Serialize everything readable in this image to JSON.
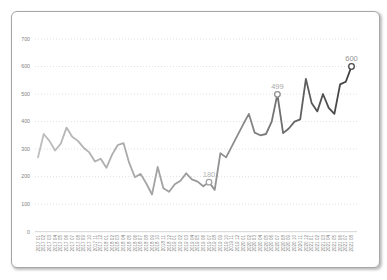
{
  "chart_data": {
    "type": "line",
    "title": "",
    "xlabel": "",
    "ylabel": "",
    "ylim": [
      0,
      700
    ],
    "y_ticks": [
      0,
      100,
      200,
      300,
      400,
      500,
      600,
      700
    ],
    "grid": "horizontal-dotted",
    "legend": "none",
    "marker_style": "open-circle",
    "categories": [
      "2017 01",
      "2017 02",
      "2017 03",
      "2017 04",
      "2017 05",
      "2017 06",
      "2017 07",
      "2017 08",
      "2017 09",
      "2017 10",
      "2017 11",
      "2017 12",
      "2018 01",
      "2018 02",
      "2018 03",
      "2018 04",
      "2018 05",
      "2018 06",
      "2018 07",
      "2018 08",
      "2018 09",
      "2018 10",
      "2018 11",
      "2018 12",
      "2019 01",
      "2019 02",
      "2019 03",
      "2019 04",
      "2019 05",
      "2019 06",
      "2019 07",
      "2019 08",
      "2019 09",
      "2019 10",
      "2019 11",
      "2019 12",
      "2020 01",
      "2020 02",
      "2020 03",
      "2020 04",
      "2020 05",
      "2020 06",
      "2020 07",
      "2020 08",
      "2020 09",
      "2020 10",
      "2020 11",
      "2020 12",
      "2021 01",
      "2021 02",
      "2021 03",
      "2021 04",
      "2021 05",
      "2021 06",
      "2021 07",
      "2021 08"
    ],
    "values": [
      270,
      355,
      330,
      295,
      320,
      378,
      345,
      330,
      305,
      288,
      255,
      265,
      232,
      280,
      315,
      322,
      250,
      198,
      210,
      175,
      135,
      235,
      158,
      145,
      172,
      185,
      212,
      190,
      182,
      165,
      180,
      152,
      285,
      270,
      310,
      350,
      390,
      428,
      360,
      350,
      355,
      400,
      499,
      358,
      375,
      400,
      408,
      555,
      468,
      437,
      500,
      450,
      428,
      535,
      545,
      600
    ],
    "annotations": [
      {
        "category": "2019 07",
        "value": 180,
        "label": "180",
        "marker_color": "#a3a3a3",
        "label_color": "#b2b2b2"
      },
      {
        "category": "2020 07",
        "value": 499,
        "label": "499",
        "marker_color": "#8f8f8f",
        "label_color": "#a9a9a9"
      },
      {
        "category": "2021 08",
        "value": 600,
        "label": "600",
        "marker_color": "#474747",
        "label_color": "#949494"
      }
    ],
    "line_gradient": [
      "#bdbdbd",
      "#a2a2a2",
      "#8a8a8a",
      "#3d3d3d"
    ]
  },
  "colors": {
    "background": "#ffffff",
    "frame_border": "#a6a6a6",
    "gridline": "#d9d9d9",
    "axis_line": "#c6c6c6",
    "tick_label": "#808080"
  }
}
